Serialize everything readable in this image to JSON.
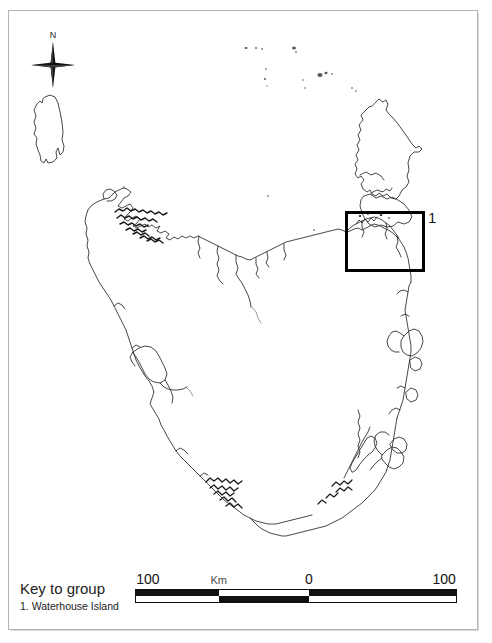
{
  "figure": {
    "kind": "locality-map",
    "region": "Tasmania, Australia",
    "background_color": "#ffffff",
    "frame_color": "#b4b4b4",
    "coastline_color": "#333333"
  },
  "compass": {
    "icon": "compass-rose-icon",
    "north_label": "N"
  },
  "inset": {
    "number_label": "1",
    "box_color": "#000000"
  },
  "legend": {
    "title": "Key to group",
    "items": [
      {
        "number": "1.",
        "label": "Waterhouse Island",
        "text": "1. Waterhouse Island"
      }
    ]
  },
  "scalebar": {
    "unit": "Km",
    "labels": [
      "100",
      "Km",
      "0",
      "100"
    ],
    "left_label": "100",
    "center_label": "0",
    "right_label": "100",
    "tick_positions_pct": [
      0,
      26,
      54,
      100
    ],
    "segments_top": [
      "black",
      "white",
      "black"
    ],
    "segments_bottom": [
      "white",
      "black",
      "white"
    ],
    "segment_widths_pct": [
      26,
      28,
      46
    ]
  },
  "map_features": {
    "main_island": "Tasmania",
    "offshore_islands": [
      "King Island",
      "Flinders Island",
      "Cape Barren Island",
      "Hunter Group islets"
    ]
  }
}
